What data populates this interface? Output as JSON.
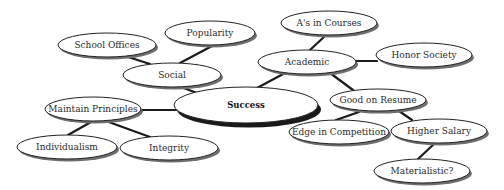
{
  "diagram": {
    "type": "concept-map",
    "center": {
      "id": "success",
      "label": "Success",
      "cx": 246,
      "cy": 105,
      "rx": 72,
      "ry": 18
    },
    "nodes": [
      {
        "id": "school_offices",
        "label": "School Offices",
        "cx": 107,
        "cy": 45,
        "rx": 49,
        "ry": 12
      },
      {
        "id": "popularity",
        "label": "Popularity",
        "cx": 210,
        "cy": 33,
        "rx": 45,
        "ry": 12
      },
      {
        "id": "social",
        "label": "Social",
        "cx": 172,
        "cy": 75,
        "rx": 49,
        "ry": 12
      },
      {
        "id": "as_in_courses",
        "label": "A's in Courses",
        "cx": 329,
        "cy": 23,
        "rx": 48,
        "ry": 12
      },
      {
        "id": "academic",
        "label": "Academic",
        "cx": 307,
        "cy": 62,
        "rx": 49,
        "ry": 12
      },
      {
        "id": "honor_society",
        "label": "Honor Society",
        "cx": 424,
        "cy": 55,
        "rx": 48,
        "ry": 12
      },
      {
        "id": "maintain_principles",
        "label": "Maintain Principles",
        "cx": 93,
        "cy": 109,
        "rx": 48,
        "ry": 12
      },
      {
        "id": "good_on_resume",
        "label": "Good on Resume",
        "cx": 378,
        "cy": 100,
        "rx": 48,
        "ry": 11
      },
      {
        "id": "individualism",
        "label": "Individualism",
        "cx": 67,
        "cy": 147,
        "rx": 50,
        "ry": 12
      },
      {
        "id": "integrity",
        "label": "Integrity",
        "cx": 169,
        "cy": 148,
        "rx": 49,
        "ry": 12
      },
      {
        "id": "edge_in_competition",
        "label": "Edge in Competition",
        "cx": 339,
        "cy": 132,
        "rx": 50,
        "ry": 12
      },
      {
        "id": "higher_salary",
        "label": "Higher Salary",
        "cx": 439,
        "cy": 131,
        "rx": 48,
        "ry": 12
      },
      {
        "id": "materialistic",
        "label": "Materialistic?",
        "cx": 422,
        "cy": 171,
        "rx": 48,
        "ry": 12
      }
    ],
    "edges": [
      {
        "from": "school_offices",
        "to": "social",
        "x1": 125,
        "y1": 56,
        "x2": 150,
        "y2": 64
      },
      {
        "from": "popularity",
        "to": "social",
        "x1": 212,
        "y1": 46,
        "x2": 180,
        "y2": 63
      },
      {
        "from": "social",
        "to": "success",
        "x1": 181,
        "y1": 87,
        "x2": 197,
        "y2": 93
      },
      {
        "from": "as_in_courses",
        "to": "academic",
        "x1": 325,
        "y1": 36,
        "x2": 310,
        "y2": 50
      },
      {
        "from": "academic",
        "to": "honor_society",
        "x1": 356,
        "y1": 61,
        "x2": 377,
        "y2": 61
      },
      {
        "from": "academic",
        "to": "success",
        "x1": 285,
        "y1": 73,
        "x2": 257,
        "y2": 88
      },
      {
        "from": "academic",
        "to": "good_on_resume",
        "x1": 330,
        "y1": 73,
        "x2": 353,
        "y2": 90
      },
      {
        "from": "maintain_principles",
        "to": "success",
        "x1": 141,
        "y1": 110,
        "x2": 176,
        "y2": 110
      },
      {
        "from": "maintain_principles",
        "to": "individualism",
        "x1": 91,
        "y1": 122,
        "x2": 68,
        "y2": 135
      },
      {
        "from": "maintain_principles",
        "to": "integrity",
        "x1": 106,
        "y1": 121,
        "x2": 150,
        "y2": 137
      },
      {
        "from": "good_on_resume",
        "to": "edge_in_competition",
        "x1": 359,
        "y1": 112,
        "x2": 336,
        "y2": 120
      },
      {
        "from": "good_on_resume",
        "to": "higher_salary",
        "x1": 399,
        "y1": 111,
        "x2": 412,
        "y2": 120
      },
      {
        "from": "higher_salary",
        "to": "materialistic",
        "x1": 434,
        "y1": 144,
        "x2": 418,
        "y2": 159
      }
    ]
  }
}
